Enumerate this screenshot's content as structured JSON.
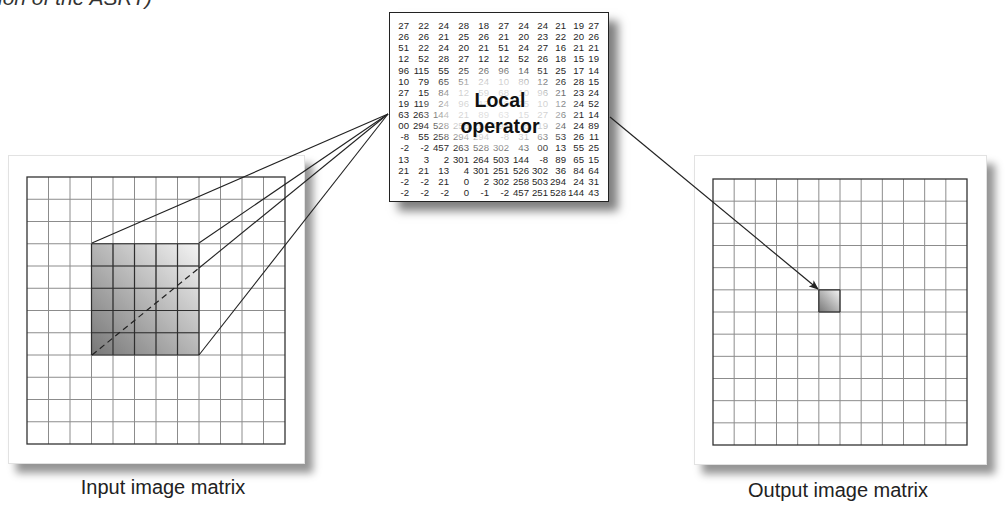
{
  "caption_fragment": "ion of the ASRT)",
  "local_operator": {
    "label_line1": "Local",
    "label_line2": "operator",
    "matrix": [
      [
        "27",
        "22",
        "24",
        "28",
        "18",
        "27",
        "24",
        "24",
        "21",
        "19",
        "27"
      ],
      [
        "26",
        "26",
        "21",
        "25",
        "26",
        "21",
        "20",
        "23",
        "22",
        "20",
        "26"
      ],
      [
        "51",
        "22",
        "24",
        "20",
        "21",
        "51",
        "24",
        "27",
        "16",
        "21",
        "21"
      ],
      [
        "12",
        "52",
        "28",
        "27",
        "12",
        "12",
        "52",
        "26",
        "18",
        "15",
        "19"
      ],
      [
        "96",
        "115",
        "55",
        "25",
        "26",
        "96",
        "14",
        "51",
        "25",
        "17",
        "14"
      ],
      [
        "10",
        "79",
        "65",
        "51",
        "24",
        "10",
        "80",
        "12",
        "26",
        "28",
        "15"
      ],
      [
        "27",
        "15",
        "84",
        "12",
        "59",
        "68",
        "10",
        "96",
        "21",
        "23",
        "24"
      ],
      [
        "19",
        "119",
        "24",
        "96",
        "13",
        "19",
        "25",
        "10",
        "12",
        "24",
        "52"
      ],
      [
        "63",
        "263",
        "144",
        "21",
        "89",
        "63",
        "15",
        "27",
        "26",
        "21",
        "14"
      ],
      [
        "00",
        "294",
        "528",
        "258",
        "294",
        "294",
        "-8",
        "19",
        "24",
        "24",
        "89"
      ],
      [
        "-8",
        "55",
        "258",
        "294",
        "294",
        "-8",
        "31",
        "63",
        "53",
        "26",
        "11"
      ],
      [
        "-2",
        "-2",
        "457",
        "263",
        "528",
        "302",
        "43",
        "00",
        "13",
        "55",
        "25"
      ],
      [
        "13",
        "3",
        "2",
        "301",
        "264",
        "503",
        "144",
        "-8",
        "89",
        "65",
        "15"
      ],
      [
        "21",
        "21",
        "13",
        "4",
        "301",
        "251",
        "526",
        "302",
        "36",
        "84",
        "64"
      ],
      [
        "-2",
        "-2",
        "21",
        "0",
        "2",
        "302",
        "258",
        "503",
        "294",
        "24",
        "31"
      ],
      [
        "-2",
        "-2",
        "-2",
        "0",
        "-1",
        "-2",
        "457",
        "251",
        "528",
        "144",
        "43"
      ]
    ]
  },
  "input_matrix": {
    "label": "Input image matrix",
    "cols": 12,
    "rows": 12,
    "highlight": {
      "col": 3,
      "row": 3,
      "width": 5,
      "height": 5
    }
  },
  "output_matrix": {
    "label": "Output image matrix",
    "cols": 12,
    "rows": 12,
    "highlight": {
      "col": 5,
      "row": 5,
      "width": 1,
      "height": 1
    }
  },
  "colors": {
    "grid_line": "#8c8c8c",
    "grid_border": "#333333",
    "projection_line": "#222222",
    "highlight_dark": "#777777",
    "highlight_light": "#f4f4f4"
  }
}
